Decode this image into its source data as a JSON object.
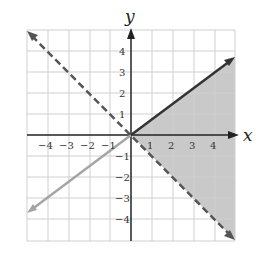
{
  "graph": {
    "x_axis_label": "x",
    "y_axis_label": "y",
    "x_ticks": [
      "−4",
      "−3",
      "−2",
      "−1",
      "1",
      "2",
      "3",
      "4"
    ],
    "y_ticks": [
      "4",
      "3",
      "2",
      "1",
      "−1",
      "−2",
      "−3",
      "−4"
    ],
    "range": {
      "x": [
        -5,
        5
      ],
      "y": [
        -5,
        5
      ]
    },
    "lines": [
      {
        "name": "boundary-solid",
        "equation": "y = 0.75x",
        "style": "solid",
        "color": "#333333"
      },
      {
        "name": "boundary-dashed",
        "equation": "y = -x",
        "style": "dashed",
        "color": "#555555"
      },
      {
        "name": "continuation-gray",
        "equation": "y = 0.75x (x<0)",
        "style": "solid",
        "color": "#a0a0a0"
      }
    ],
    "shaded_region": {
      "description": "region between y = 0.75x and y = -x for x > 0",
      "color": "#c8c8c8"
    }
  }
}
